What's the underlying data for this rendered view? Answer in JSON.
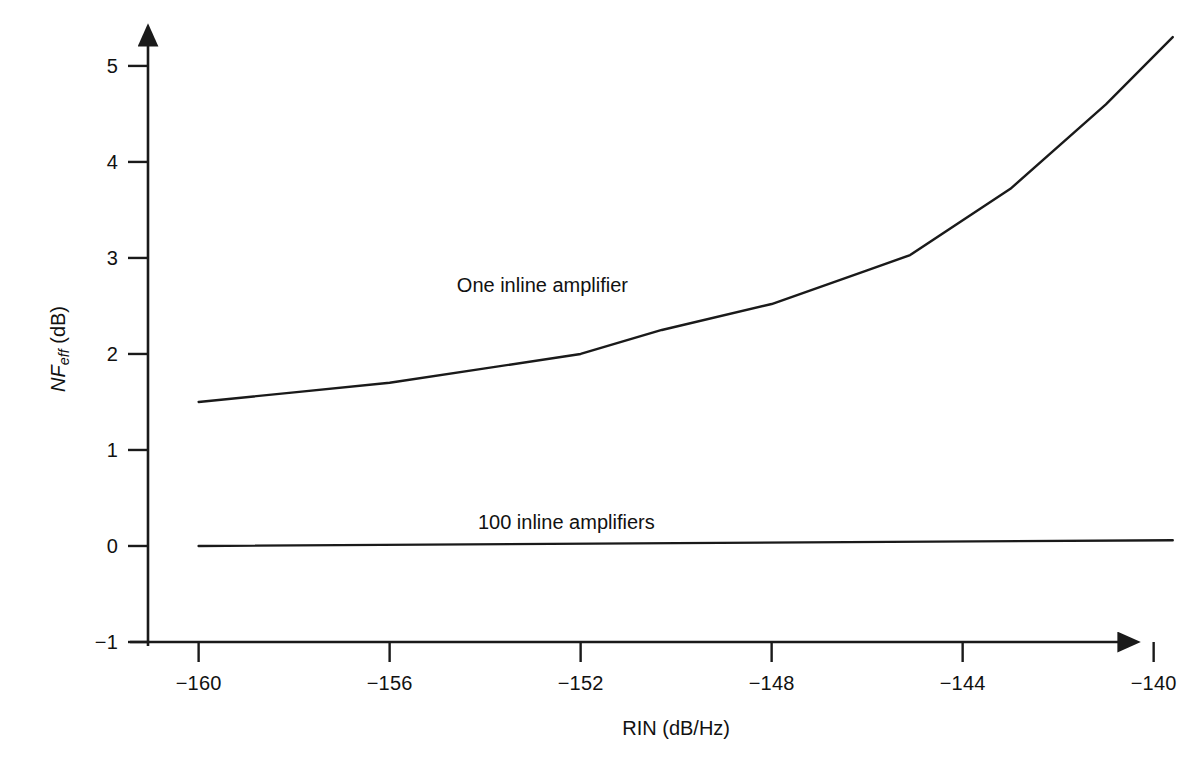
{
  "chart_data": {
    "type": "line",
    "title": "",
    "xlabel": "RIN (dB/Hz)",
    "ylabel_prefix": "NF",
    "ylabel_subscript": "eff",
    "ylabel_units": " (dB)",
    "ylabel_plain": "NFeff (dB)",
    "xlim": [
      -161,
      -138.8
    ],
    "ylim": [
      -1,
      5.45
    ],
    "xticks": [
      -160,
      -156,
      -152,
      -148,
      -144,
      -140
    ],
    "xtick_labels": [
      "−160",
      "−156",
      "−152",
      "−148",
      "−144",
      "−140"
    ],
    "yticks": [
      -1,
      0,
      1,
      2,
      3,
      4,
      5
    ],
    "ytick_labels": [
      "−1",
      "0",
      "1",
      "2",
      "3",
      "4",
      "5"
    ],
    "grid": false,
    "legend": "none",
    "axis_style": "arrow-ended L-axes",
    "line_color": "#1a1a1a",
    "series": [
      {
        "name": "One inline amplifier",
        "annotation": "One inline amplifier",
        "annotation_x": -152.8,
        "annotation_y": 2.72,
        "x": [
          -160,
          -158,
          -156,
          -154,
          -152,
          -150.3,
          -148,
          -146,
          -145.1,
          -143,
          -141,
          -139.6
        ],
        "y": [
          1.5,
          1.6,
          1.7,
          1.85,
          2.0,
          2.25,
          2.52,
          2.87,
          3.03,
          3.72,
          4.6,
          5.3
        ]
      },
      {
        "name": "100 inline amplifiers",
        "annotation": "100 inline amplifiers",
        "annotation_x": -152.3,
        "annotation_y": 0.25,
        "x": [
          -160,
          -150,
          -139.6
        ],
        "y": [
          0.0,
          0.03,
          0.06
        ]
      }
    ]
  },
  "axes_geometry": {
    "x_pixel_min": 148,
    "x_pixel_max": 1125,
    "x_value_min": -161.06,
    "x_value_max": -140.6,
    "y_pixel_min": 642,
    "y_pixel_max": 40,
    "y_value_min": -1,
    "y_value_max": 5.27
  }
}
